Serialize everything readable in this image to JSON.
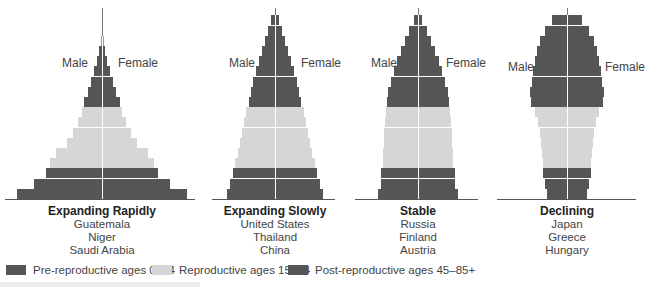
{
  "colors": {
    "pre_reproductive": "#555555",
    "reproductive": "#d6d6d6",
    "post_reproductive": "#555555",
    "axis": "#555555"
  },
  "labels": {
    "male": "Male",
    "female": "Female"
  },
  "pyramids": [
    {
      "id": "expanding-rapidly",
      "title": "Expanding Rapidly",
      "countries": [
        "Guatemala",
        "Niger",
        "Saudi Arabia"
      ],
      "center_x": 102,
      "axis_left": 5,
      "axis_right": 195,
      "spike_top": 8,
      "male_label_x": 62,
      "female_label_x": 118,
      "side_label_y": 56,
      "bars": [
        {
          "half": 85,
          "cat": "pre"
        },
        {
          "half": 68,
          "cat": "pre"
        },
        {
          "half": 56,
          "cat": "pre"
        },
        {
          "half": 52,
          "cat": "rep"
        },
        {
          "half": 46,
          "cat": "rep"
        },
        {
          "half": 35,
          "cat": "rep"
        },
        {
          "half": 29,
          "cat": "rep"
        },
        {
          "half": 24,
          "cat": "rep"
        },
        {
          "half": 20,
          "cat": "rep"
        },
        {
          "half": 18,
          "cat": "post"
        },
        {
          "half": 14,
          "cat": "post"
        },
        {
          "half": 11,
          "cat": "post"
        },
        {
          "half": 8,
          "cat": "post"
        },
        {
          "half": 5,
          "cat": "post"
        },
        {
          "half": 3,
          "cat": "post"
        },
        {
          "half": 1.5,
          "cat": "spike"
        }
      ]
    },
    {
      "id": "expanding-slowly",
      "title": "Expanding Slowly",
      "countries": [
        "United States",
        "Thailand",
        "China"
      ],
      "center_x": 275,
      "axis_left": 212,
      "axis_right": 335,
      "spike_top": 8,
      "male_label_x": 229,
      "female_label_x": 301,
      "side_label_y": 56,
      "bars": [
        {
          "half": 48,
          "cat": "pre"
        },
        {
          "half": 45,
          "cat": "pre"
        },
        {
          "half": 42,
          "cat": "pre"
        },
        {
          "half": 40,
          "cat": "rep"
        },
        {
          "half": 37,
          "cat": "rep"
        },
        {
          "half": 35,
          "cat": "rep"
        },
        {
          "half": 33,
          "cat": "rep"
        },
        {
          "half": 31,
          "cat": "rep"
        },
        {
          "half": 29,
          "cat": "rep"
        },
        {
          "half": 26,
          "cat": "post"
        },
        {
          "half": 24,
          "cat": "post"
        },
        {
          "half": 22,
          "cat": "post"
        },
        {
          "half": 19,
          "cat": "post"
        },
        {
          "half": 16,
          "cat": "post"
        },
        {
          "half": 13,
          "cat": "post"
        },
        {
          "half": 10,
          "cat": "post"
        },
        {
          "half": 7,
          "cat": "post"
        },
        {
          "half": 4,
          "cat": "post"
        }
      ]
    },
    {
      "id": "stable",
      "title": "Stable",
      "countries": [
        "Russia",
        "Finland",
        "Austria"
      ],
      "center_x": 418,
      "axis_left": 355,
      "axis_right": 478,
      "spike_top": 8,
      "male_label_x": 371,
      "female_label_x": 446,
      "side_label_y": 56,
      "bars": [
        {
          "half": 40,
          "cat": "pre"
        },
        {
          "half": 37,
          "cat": "pre"
        },
        {
          "half": 37,
          "cat": "pre"
        },
        {
          "half": 35,
          "cat": "rep"
        },
        {
          "half": 35,
          "cat": "rep"
        },
        {
          "half": 34,
          "cat": "rep"
        },
        {
          "half": 34,
          "cat": "rep"
        },
        {
          "half": 33,
          "cat": "rep"
        },
        {
          "half": 32,
          "cat": "rep"
        },
        {
          "half": 31,
          "cat": "post"
        },
        {
          "half": 30,
          "cat": "post"
        },
        {
          "half": 27,
          "cat": "post"
        },
        {
          "half": 24,
          "cat": "post"
        },
        {
          "half": 21,
          "cat": "post"
        },
        {
          "half": 17,
          "cat": "post"
        },
        {
          "half": 13,
          "cat": "post"
        },
        {
          "half": 9,
          "cat": "post"
        },
        {
          "half": 4,
          "cat": "post"
        }
      ]
    },
    {
      "id": "declining",
      "title": "Declining",
      "countries": [
        "Japan",
        "Greece",
        "Hungary"
      ],
      "center_x": 567,
      "axis_left": 497,
      "axis_right": 636,
      "spike_top": 8,
      "male_label_x": 508,
      "female_label_x": 605,
      "side_label_y": 60,
      "bars": [
        {
          "half": 20,
          "cat": "pre"
        },
        {
          "half": 22,
          "cat": "pre"
        },
        {
          "half": 24,
          "cat": "pre"
        },
        {
          "half": 24,
          "cat": "rep"
        },
        {
          "half": 25,
          "cat": "rep"
        },
        {
          "half": 26,
          "cat": "rep"
        },
        {
          "half": 27,
          "cat": "rep"
        },
        {
          "half": 29,
          "cat": "rep"
        },
        {
          "half": 32,
          "cat": "rep"
        },
        {
          "half": 36,
          "cat": "post"
        },
        {
          "half": 37,
          "cat": "post"
        },
        {
          "half": 35,
          "cat": "post"
        },
        {
          "half": 34,
          "cat": "post"
        },
        {
          "half": 32,
          "cat": "post"
        },
        {
          "half": 30,
          "cat": "post"
        },
        {
          "half": 27,
          "cat": "post"
        },
        {
          "half": 22,
          "cat": "post"
        },
        {
          "half": 15,
          "cat": "post"
        }
      ]
    }
  ],
  "legend": {
    "items": [
      {
        "label": "Pre-reproductive ages 0–14",
        "color": "#555555"
      },
      {
        "label": "Reproductive ages 15–44",
        "color": "#d6d6d6"
      },
      {
        "label": "Post-reproductive ages 45–85+",
        "color": "#555555"
      }
    ]
  }
}
